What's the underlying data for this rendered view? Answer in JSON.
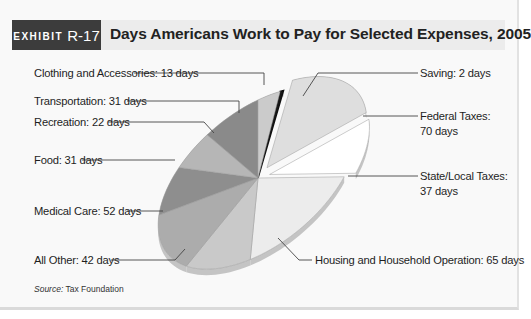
{
  "header": {
    "exhibit_word": "EXHIBIT",
    "exhibit_number": "R-17",
    "title": "Days Americans Work to Pay for Selected Expenses, 2005"
  },
  "source": {
    "prefix": "Source:",
    "text": "Tax Foundation"
  },
  "chart_data": {
    "type": "pie",
    "title": "Days Americans Work to Pay for Selected Expenses, 2005",
    "unit": "days",
    "three_d": true,
    "exploded": [
      "Federal Taxes",
      "State/Local Taxes"
    ],
    "slices": [
      {
        "name": "Saving",
        "value": 2,
        "label": "Saving: 2 days",
        "color": "#1a1a1a"
      },
      {
        "name": "Federal Taxes",
        "value": 70,
        "label_lines": [
          "Federal Taxes:",
          "70 days"
        ],
        "color": "#dedede"
      },
      {
        "name": "State/Local Taxes",
        "value": 37,
        "label_lines": [
          "State/Local Taxes:",
          "37 days"
        ],
        "color": "#ffffff"
      },
      {
        "name": "Housing and Household Operation",
        "value": 65,
        "label": "Housing and Household Operation: 65 days",
        "color": "#ececec"
      },
      {
        "name": "All Other",
        "value": 42,
        "label": "All Other: 42 days",
        "color": "#c9c9c9"
      },
      {
        "name": "Medical Care",
        "value": 52,
        "label": "Medical Care: 52 days",
        "color": "#acacac"
      },
      {
        "name": "Food",
        "value": 31,
        "label": "Food: 31 days",
        "color": "#8e8e8e"
      },
      {
        "name": "Recreation",
        "value": 22,
        "label": "Recreation: 22 days",
        "color": "#b6b6b6"
      },
      {
        "name": "Transportation",
        "value": 31,
        "label": "Transportation: 31 days",
        "color": "#8a8a8a"
      },
      {
        "name": "Clothing and Accessories",
        "value": 13,
        "label": "Clothing and Accessories: 13 days",
        "color": "#cbcbcb"
      }
    ],
    "total": 365
  }
}
